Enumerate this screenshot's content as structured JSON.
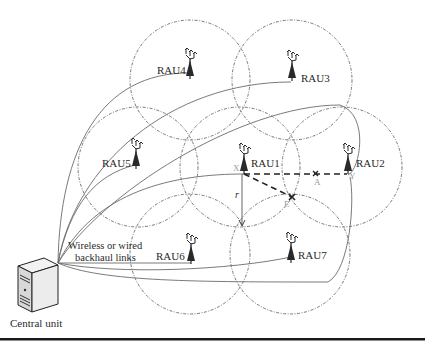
{
  "diagram": {
    "type": "network-topology",
    "description_labels": {
      "central_unit": "Central unit",
      "backhaul_line1": "Wireless or wired",
      "backhaul_line2": "backhaul links",
      "radius": "r"
    },
    "raus": [
      {
        "id": "RAU1",
        "label": "RAU1"
      },
      {
        "id": "RAU2",
        "label": "RAU2"
      },
      {
        "id": "RAU3",
        "label": "RAU3"
      },
      {
        "id": "RAU4",
        "label": "RAU4"
      },
      {
        "id": "RAU5",
        "label": "RAU5"
      },
      {
        "id": "RAU6",
        "label": "RAU6"
      },
      {
        "id": "RAU7",
        "label": "RAU7"
      }
    ],
    "points": {
      "X": "X",
      "A": "A",
      "E": "E",
      "Y": "Y"
    },
    "colors": {
      "line": "#6b6b6b",
      "circle": "#555555",
      "dashed_path": "#222222",
      "text": "#2a2a2a",
      "rule": "#1a1a1a"
    }
  }
}
